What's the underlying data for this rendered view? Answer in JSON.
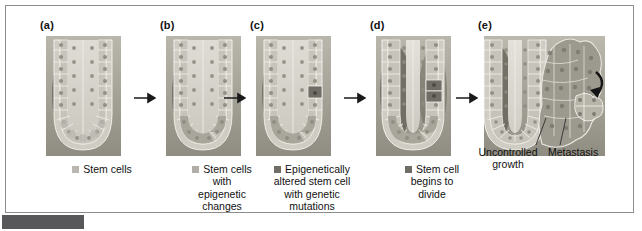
{
  "figure": {
    "type": "biological-process-diagram",
    "panel_count": 5,
    "arrow_count": 4,
    "colors": {
      "page_background": "#ffffff",
      "frame_border": "#8d8d8d",
      "caption_bar": "#58585a",
      "text": "#111111",
      "tissue_light": "#cfcdc4",
      "tissue_mid": "#a9a69b",
      "tissue_dark": "#7d7a70",
      "lumen": "#d8d6cd",
      "swatch_stem": "#b9b7b0",
      "swatch_epigenetic": "#b0aea6",
      "swatch_altered": "#6f6d66",
      "swatch_dividing": "#6f6d66",
      "arrow": "#1a1a1a"
    },
    "panels": [
      {
        "id": "a",
        "label": "(a)",
        "image_name": "normal-intestinal-crypt",
        "legend": {
          "has_swatch": true,
          "swatch_color": "#b9b7b0",
          "lines": [
            "Stem cells"
          ]
        }
      },
      {
        "id": "b",
        "label": "(b)",
        "image_name": "crypt-with-epigenetic-changes",
        "legend": {
          "has_swatch": true,
          "swatch_color": "#b0aea6",
          "lines": [
            "Stem cells",
            "with",
            "epigenetic",
            "changes"
          ]
        }
      },
      {
        "id": "c",
        "label": "(c)",
        "image_name": "crypt-with-genetically-mutated-stem-cell",
        "legend": {
          "has_swatch": true,
          "swatch_color": "#6f6d66",
          "lines": [
            "Epigenetically",
            "altered stem cell",
            "with genetic",
            "mutations"
          ]
        }
      },
      {
        "id": "d",
        "label": "(d)",
        "image_name": "crypt-with-dividing-stem-cell",
        "legend": {
          "has_swatch": true,
          "swatch_color": "#6f6d66",
          "lines": [
            "Stem cell",
            "begins to",
            "divide"
          ]
        }
      },
      {
        "id": "e",
        "label": "(e)",
        "image_name": "crypt-with-tumour-and-metastasis",
        "legend": {
          "has_swatch": false,
          "callouts": [
            {
              "name": "uncontrolled-growth",
              "lines": [
                "Uncontrolled",
                "growth"
              ]
            },
            {
              "name": "metastasis",
              "lines": [
                "Metastasis"
              ]
            }
          ]
        }
      }
    ]
  }
}
